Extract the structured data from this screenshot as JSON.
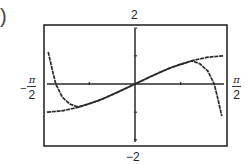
{
  "panel_label": ")",
  "labels": {
    "y_max": "2",
    "y_min": "−2",
    "x_min_minus": "−",
    "x_min_num": "π",
    "x_min_den": "2",
    "x_max_num": "π",
    "x_max_den": "2"
  },
  "colors": {
    "frame": "#2a2a2a",
    "axis": "#2a2a2a",
    "curve": "#2a2a2a",
    "background": "#ffffff"
  },
  "chart_data": {
    "type": "line",
    "title": "",
    "xlabel": "",
    "ylabel": "",
    "xlim": [
      -1.5708,
      1.5708
    ],
    "ylim": [
      -2,
      2
    ],
    "xlim_labels": [
      "-π/2",
      "π/2"
    ],
    "ylim_labels": [
      "-2",
      "2"
    ],
    "x_ticks": [
      -0.7854,
      0.7854
    ],
    "y_ticks": [
      -1,
      1
    ],
    "grid": false,
    "legend": null,
    "series": [
      {
        "name": "f(x) (bounded curve, sin x)",
        "style": "flat",
        "x": [
          -1.51,
          -1.25,
          -1.0,
          -0.75,
          -0.5,
          -0.25,
          0.0,
          0.25,
          0.5,
          0.75,
          1.0,
          1.25,
          1.51
        ],
        "y": [
          -1.0,
          -0.95,
          -0.84,
          -0.68,
          -0.48,
          -0.25,
          0.0,
          0.25,
          0.48,
          0.68,
          0.84,
          0.95,
          1.0
        ]
      },
      {
        "name": "polynomial approximation (steep at ends)",
        "style": "steep",
        "x": [
          -1.49,
          -1.42,
          -1.36,
          -1.25,
          -1.12,
          -0.98,
          -0.6,
          -0.3,
          0.0,
          0.3,
          0.6,
          0.98,
          1.12,
          1.25,
          1.36,
          1.42,
          1.49
        ],
        "y": [
          1.14,
          0.5,
          0.0,
          -0.46,
          -0.71,
          -0.82,
          -0.57,
          -0.29,
          0.0,
          0.29,
          0.57,
          0.82,
          0.71,
          0.46,
          0.0,
          -0.5,
          -1.14
        ]
      }
    ]
  }
}
